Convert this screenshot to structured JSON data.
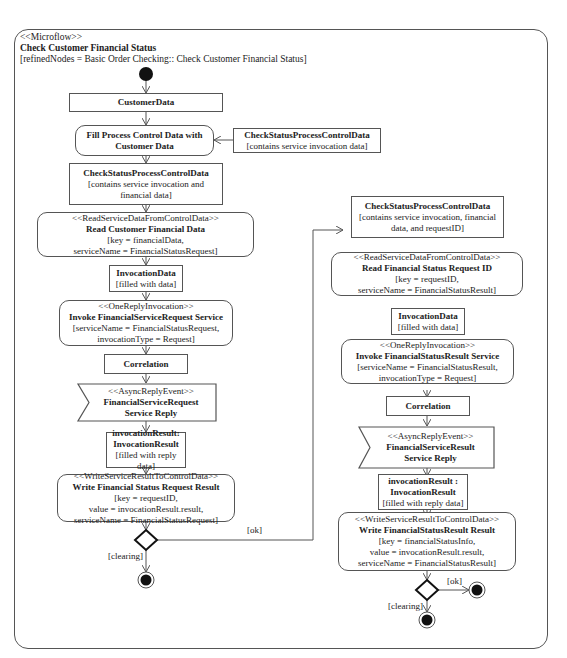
{
  "header": {
    "stereotype": "<<Microflow>>",
    "title": "Check Customer Financial Status",
    "refined": "[refinedNodes = Basic Order Checking:: Check Customer Financial Status]"
  },
  "left": {
    "customer_data": "CustomerData",
    "fill": [
      "Fill Process Control Data with",
      "Customer Data"
    ],
    "side_obj": {
      "title": "CheckStatusProcessControlData",
      "note": "[contains service invocation data]"
    },
    "cspcd": {
      "title": "CheckStatusProcessControlData",
      "note1": "[contains service invocation and",
      "note2": "financial data]"
    },
    "read": {
      "stereo": "<<ReadServiceDataFromControlData>>",
      "title": "Read Customer Financial Data",
      "p1": "[key = financialData,",
      "p2": "serviceName = FinancialStatusRequest]"
    },
    "inv_data": {
      "title": "InvocationData",
      "note": "[filled with data]"
    },
    "invoke": {
      "stereo": "<<OneReplyInvocation>>",
      "title": "Invoke FinancialServiceRequest Service",
      "p1": "[serviceName = FinancialStatusRequest,",
      "p2": "invocationType = Request]"
    },
    "correlation": "Correlation",
    "event": {
      "stereo": "<<AsyncReplyEvent>>",
      "t1": "FinancialServiceRequest",
      "t2": "Service Reply"
    },
    "result": {
      "t1": "invocationResult:",
      "t2": "InvocationResult",
      "note": "[filled with reply data]"
    },
    "write": {
      "stereo": "<<WriteServiceResultToControlData>>",
      "title": "Write Financial Status Request Result",
      "p1": "[key = requestID,",
      "p2": "value = invocationResult.result,",
      "p3": "serviceName = FinancialStatusRequest]"
    },
    "guard_ok": "[ok]",
    "guard_clearing": "[clearing]"
  },
  "right": {
    "cspcd": {
      "title": "CheckStatusProcessControlData",
      "note1": "[contains service invocation, financial",
      "note2": "data, and requestID]"
    },
    "read": {
      "stereo": "<<ReadServiceDataFromControlData>>",
      "title": "Read Financial Status Request ID",
      "p1": "[key = requestID,",
      "p2": "serviceName = FinancialStatusResult]"
    },
    "inv_data": {
      "title": "InvocationData",
      "note": "[filled with data]"
    },
    "invoke": {
      "stereo": "<<OneReplyInvocation>>",
      "title": "Invoke FinancialStatusResult Service",
      "p1": "[serviceName = FinancialStatusResult,",
      "p2": "invocationType = Request]"
    },
    "correlation": "Correlation",
    "event": {
      "stereo": "<<AsyncReplyEvent>>",
      "t1": "FinancialServiceResult",
      "t2": "Service Reply"
    },
    "result": {
      "t1": "invocationResult :",
      "t2": "InvocationResult",
      "note": "[filled with reply data]"
    },
    "write": {
      "stereo": "<<WriteServiceResultToControlData>>",
      "title": "Write FinancialStatusResult Result",
      "p1": "[key = financialStatusInfo,",
      "p2": "value = invocationResult.result,",
      "p3": "serviceName = FinancialStatusResult]"
    },
    "guard_ok": "[ok]",
    "guard_clearing": "[clearing]"
  }
}
